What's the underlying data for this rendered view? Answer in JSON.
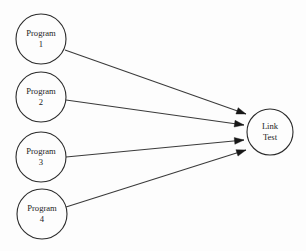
{
  "diagram": {
    "background_color": "#fdfdfd",
    "node_stroke_color": "#2b2b2b",
    "edge_color": "#3a3a3a",
    "arrow_color": "#171717",
    "text_color": "#1c1c1c",
    "source_nodes": [
      {
        "id": "program-1",
        "line1": "Program",
        "line2": "1",
        "cx": 41,
        "cy": 39,
        "r": 25
      },
      {
        "id": "program-2",
        "line1": "Program",
        "line2": "2",
        "cx": 41,
        "cy": 97,
        "r": 25
      },
      {
        "id": "program-3",
        "line1": "Program",
        "line2": "3",
        "cx": 41,
        "cy": 157,
        "r": 25
      },
      {
        "id": "program-4",
        "line1": "Program",
        "line2": "4",
        "cx": 42,
        "cy": 214,
        "r": 25
      }
    ],
    "target_node": {
      "id": "link-test",
      "line1": "Link",
      "line2": "Test",
      "cx": 270,
      "cy": 132,
      "r": 23
    },
    "edges": [
      {
        "id": "edge-program-1-to-link-test",
        "from": "program-1",
        "to": "link-test",
        "x1": 65,
        "y1": 50,
        "x2": 246,
        "y2": 114
      },
      {
        "id": "edge-program-2-to-link-test",
        "from": "program-2",
        "to": "link-test",
        "x1": 66,
        "y1": 100,
        "x2": 244,
        "y2": 125
      },
      {
        "id": "edge-program-3-to-link-test",
        "from": "program-3",
        "to": "link-test",
        "x1": 66,
        "y1": 157,
        "x2": 244,
        "y2": 140
      },
      {
        "id": "edge-program-4-to-link-test",
        "from": "program-4",
        "to": "link-test",
        "x1": 66,
        "y1": 207,
        "x2": 246,
        "y2": 150
      }
    ]
  }
}
